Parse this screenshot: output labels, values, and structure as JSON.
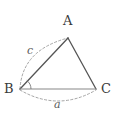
{
  "figure": {
    "background_color": "#ffffff",
    "width": 116,
    "height": 116,
    "vertices": [
      {
        "name": "A",
        "label": "A",
        "x": 68,
        "y": 38,
        "label_x": 63,
        "label_y": 14
      },
      {
        "name": "B",
        "label": "B",
        "x": 20,
        "y": 89,
        "label_x": 4,
        "label_y": 82
      },
      {
        "name": "C",
        "label": "C",
        "x": 96,
        "y": 89,
        "label_x": 101,
        "label_y": 82
      }
    ],
    "sides": [
      {
        "name": "AB",
        "label": "c",
        "style": "solid",
        "color": "#555555"
      },
      {
        "name": "AC",
        "label": "",
        "style": "solid",
        "color": "#555555"
      },
      {
        "name": "BC",
        "label": "a",
        "style": "solid",
        "color": "#888888"
      }
    ],
    "arcs": [
      {
        "name": "arc-c",
        "label": "c",
        "from": "B",
        "to": "A",
        "style": "dashed",
        "color": "#9a9a9a",
        "bow": "outward-left",
        "label_x": 27,
        "label_y": 45
      },
      {
        "name": "arc-a",
        "label": "a",
        "from": "B",
        "to": "C",
        "style": "dashed",
        "color": "#9a9a9a",
        "bow": "outward-down",
        "label_x": 54,
        "label_y": 99
      }
    ],
    "angle_marks": [
      {
        "name": "angle-B",
        "vertex": "B",
        "label": "",
        "style": "solid",
        "color": "#777777"
      }
    ],
    "colors": {
      "stroke_dark": "#555555",
      "stroke_base": "#888888",
      "stroke_dashed": "#9a9a9a",
      "text_vertex": "#3a3a3a",
      "text_side": "#5a5a5a"
    }
  }
}
